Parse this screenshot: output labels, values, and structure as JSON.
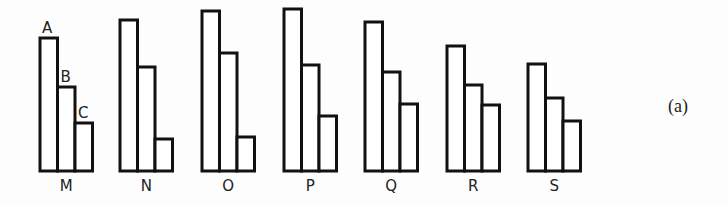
{
  "figure_label": "(a)",
  "bar_letters": [
    "A",
    "B",
    "C"
  ],
  "chart_data": {
    "type": "bar",
    "title": "",
    "xlabel": "",
    "ylabel": "",
    "categories": [
      "M",
      "N",
      "O",
      "P",
      "Q",
      "R",
      "S"
    ],
    "series": [
      {
        "name": "A",
        "values": [
          133,
          151,
          160,
          162,
          149,
          125,
          107
        ]
      },
      {
        "name": "B",
        "values": [
          84,
          104,
          118,
          106,
          99,
          86,
          73
        ]
      },
      {
        "name": "C",
        "values": [
          48,
          32,
          34,
          55,
          67,
          66,
          50
        ]
      }
    ],
    "units": "relative height (px, estimated; no axis shown)",
    "grid": false,
    "legend": "letters A, B, C labeled above the bars of group M only",
    "annotation": "(a)"
  },
  "groups": [
    {
      "label": "M",
      "x": 40
    },
    {
      "label": "N",
      "x": 120
    },
    {
      "label": "O",
      "x": 202
    },
    {
      "label": "P",
      "x": 284
    },
    {
      "label": "Q",
      "x": 365
    },
    {
      "label": "R",
      "x": 447
    },
    {
      "label": "S",
      "x": 528
    }
  ]
}
